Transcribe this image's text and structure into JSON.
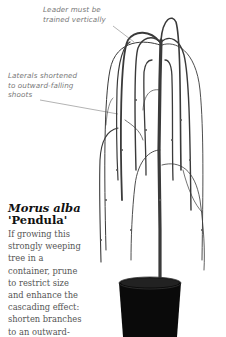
{
  "annotations": [
    {
      "id": "leader",
      "lines": [
        "Leader must be",
        "trained vertically"
      ]
    },
    {
      "id": "laterals",
      "lines": [
        "Laterals shortened",
        "to outward-falling",
        "shoots"
      ]
    }
  ],
  "caption": {
    "title_italic": "Morus alba",
    "title_cultivar": "'Pendula'",
    "body_lines": [
      "If growing this",
      "strongly weeping",
      "tree in a",
      "container, prune",
      "to restrict size",
      "and enhance the",
      "cascading effect:",
      "shorten branches",
      "to an outward-"
    ]
  },
  "image": {
    "subject": "weeping-mulberry-tree-in-black-pot",
    "pot_color": "#0a0a0a",
    "branch_color": "#3a3a3a"
  }
}
